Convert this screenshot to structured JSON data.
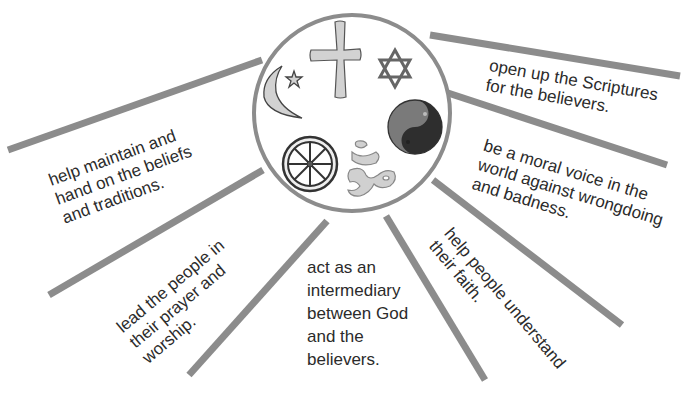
{
  "diagram": {
    "type": "radial-spoke",
    "center_symbols": [
      {
        "name": "Christian cross",
        "icon": "cross-icon"
      },
      {
        "name": "Islamic crescent and star",
        "icon": "crescent-star-icon"
      },
      {
        "name": "Star of David",
        "icon": "star-of-david-icon"
      },
      {
        "name": "Yin yang",
        "icon": "yin-yang-icon"
      },
      {
        "name": "Dharma wheel",
        "icon": "dharma-wheel-icon"
      },
      {
        "name": "Om",
        "icon": "om-icon"
      }
    ],
    "spokes": [
      {
        "id": "maintain",
        "text": "help maintain and\nhand on the beliefs\nand traditions."
      },
      {
        "id": "lead",
        "text": "lead the people in\ntheir prayer and\nworship."
      },
      {
        "id": "intermediary",
        "text": "act as an\nintermediary\nbetween God\nand the\nbelievers."
      },
      {
        "id": "understand",
        "text": "help people understand\ntheir faith."
      },
      {
        "id": "moral",
        "text": "be a moral voice in the\nworld against wrongdoing\nand badness."
      },
      {
        "id": "scriptures",
        "text": "open up the Scriptures\nfor the believers."
      }
    ],
    "colors": {
      "spoke": "#8c8c8c",
      "circle_stroke": "#8c8c8c",
      "symbol_fill": "#cfcfcf",
      "symbol_dark": "#3a3a3a",
      "text": "#2b2b2b"
    }
  }
}
